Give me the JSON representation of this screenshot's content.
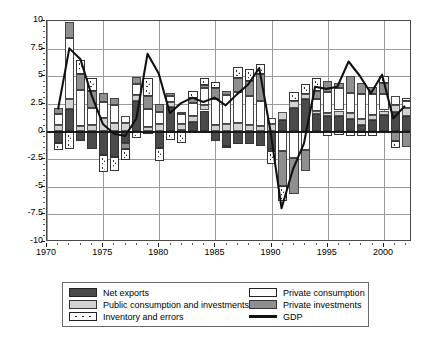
{
  "chart_data": {
    "type": "bar",
    "title": "",
    "subtitle": "",
    "xlabel": "",
    "ylabel": "",
    "stacked": true,
    "grid": true,
    "legend_position": "bottom",
    "xlim": [
      1970,
      2002.5
    ],
    "ylim": [
      -10,
      10
    ],
    "yticks": [
      "10",
      "7.5",
      "5",
      "2.5",
      "0",
      "-2.5",
      "-5",
      "-7.5",
      "-10"
    ],
    "ytick_values": [
      10,
      7.5,
      5,
      2.5,
      0,
      -2.5,
      -5,
      -7.5,
      -10
    ],
    "xticks": [
      "1970",
      "1975",
      "1980",
      "1985",
      "1990",
      "1995",
      "2000"
    ],
    "xtick_values": [
      1970,
      1975,
      1980,
      1985,
      1990,
      1995,
      2000
    ],
    "x": [
      1971,
      1972,
      1973,
      1974,
      1975,
      1976,
      1977,
      1978,
      1979,
      1980,
      1981,
      1982,
      1983,
      1984,
      1985,
      1986,
      1987,
      1988,
      1989,
      1990,
      1991,
      1992,
      1993,
      1994,
      1995,
      1996,
      1997,
      1998,
      1999,
      2000,
      2001,
      2002
    ],
    "categories": [
      "1971",
      "1972",
      "1973",
      "1974",
      "1975",
      "1976",
      "1977",
      "1978",
      "1979",
      "1980",
      "1981",
      "1982",
      "1983",
      "1984",
      "1985",
      "1986",
      "1987",
      "1988",
      "1989",
      "1990",
      "1991",
      "1992",
      "1993",
      "1994",
      "1995",
      "1996",
      "1997",
      "1998",
      "1999",
      "2000",
      "2001",
      "2002"
    ],
    "series": [
      {
        "name": "Net exports",
        "key": "net",
        "color": "#4a4a4a",
        "values": [
          -1.0,
          2.0,
          -0.9,
          -1.6,
          -2.1,
          -2.3,
          -1.0,
          2.8,
          -0.2,
          -1.5,
          2.2,
          0.1,
          0.9,
          1.9,
          -0.9,
          -1.3,
          -1.1,
          -1.1,
          -1.3,
          -1.6,
          1.0,
          2.1,
          2.9,
          1.6,
          1.4,
          1.4,
          1.1,
          0.6,
          1.0,
          1.5,
          1.8,
          1.4
        ]
      },
      {
        "name": "Public consumption and investments",
        "key": "pubc",
        "color": "#d2d2d2",
        "values": [
          0.6,
          0.9,
          0.5,
          0.6,
          1.2,
          0.8,
          0.8,
          0.5,
          0.4,
          0.7,
          0.5,
          0.6,
          0.5,
          0.5,
          0.6,
          0.7,
          0.8,
          0.6,
          0.5,
          0.7,
          0.8,
          0.7,
          0.5,
          0.3,
          0.3,
          0.5,
          0.6,
          0.5,
          0.5,
          0.4,
          0.6,
          0.7
        ]
      },
      {
        "name": "Private consumption",
        "key": "privc",
        "color": "#ffffff",
        "values": [
          1.0,
          5.6,
          3.3,
          1.5,
          1.5,
          1.6,
          0.6,
          1.0,
          1.6,
          1.1,
          0.5,
          0.9,
          1.2,
          1.5,
          2.3,
          2.6,
          2.8,
          2.6,
          2.3,
          0.5,
          -1.8,
          -2.4,
          -1.7,
          1.0,
          1.9,
          2.0,
          1.8,
          2.3,
          1.9,
          1.5,
          0.8,
          0.7
        ]
      },
      {
        "name": "Private investments",
        "key": "privi",
        "color": "#8f8f8f",
        "values": [
          0.5,
          1.4,
          1.4,
          1.6,
          0.8,
          0.6,
          -0.6,
          0.6,
          1.2,
          0.7,
          0.3,
          0.2,
          0.4,
          0.3,
          1.0,
          0.4,
          1.2,
          1.4,
          2.4,
          -0.2,
          -3.1,
          -3.3,
          -1.9,
          0.8,
          1.0,
          0.5,
          1.5,
          1.0,
          0.6,
          1.0,
          -0.9,
          -1.4
        ]
      },
      {
        "name": "Inventory and errors",
        "key": "inv",
        "color": "#ffffff",
        "hatch": "dotted",
        "values": [
          -0.7,
          -1.6,
          1.3,
          1.1,
          -1.6,
          -1.3,
          -1.0,
          -0.6,
          1.6,
          -1.2,
          -0.8,
          -1.0,
          0.7,
          0.6,
          0.6,
          -0.1,
          1.0,
          1.1,
          0.9,
          -1.1,
          -1.4,
          0.8,
          0.9,
          1.1,
          -0.4,
          -0.3,
          -0.4,
          -0.4,
          -0.4,
          0.6,
          -0.6,
          0.2
        ]
      }
    ],
    "line_series": {
      "name": "GDP",
      "color": "#111111",
      "x": [
        1971,
        1972,
        1973,
        1974,
        1975,
        1976,
        1977,
        1978,
        1979,
        1980,
        1981,
        1982,
        1983,
        1984,
        1985,
        1986,
        1987,
        1988,
        1989,
        1990,
        1991,
        1992,
        1993,
        1994,
        1995,
        1996,
        1997,
        1998,
        1999,
        2000,
        2001,
        2002
      ],
      "values": [
        2.0,
        7.5,
        6.5,
        3.2,
        0.6,
        -0.3,
        -0.5,
        1.1,
        7.0,
        5.2,
        1.6,
        2.5,
        3.0,
        2.6,
        3.0,
        2.3,
        3.3,
        4.2,
        5.7,
        0.0,
        -7.1,
        -3.6,
        -1.2,
        4.0,
        3.8,
        4.0,
        6.3,
        5.0,
        3.4,
        5.1,
        1.1,
        2.2
      ]
    }
  },
  "legend": {
    "items_left": [
      {
        "label": "Net exports",
        "swatch": "net"
      },
      {
        "label": "Public consumption and investments",
        "swatch": "pubc"
      },
      {
        "label": "Inventory and errors",
        "swatch": "inv"
      }
    ],
    "items_right": [
      {
        "label": "Private consumption",
        "swatch": "privc"
      },
      {
        "label": "Private investments",
        "swatch": "privi"
      },
      {
        "label": "GDP",
        "swatch": "gdp"
      }
    ]
  }
}
